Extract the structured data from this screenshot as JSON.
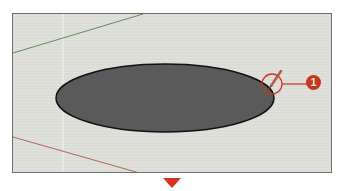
{
  "viewport": {
    "background": "#dcdcd6",
    "green_axis_color": "#5f8a5a",
    "red_axis_color": "#b0645a",
    "blue_axis_color": "#f4f4e8"
  },
  "shape": {
    "type": "ellipse",
    "fill": "#5a5a5a",
    "stroke": "#111111"
  },
  "callout": {
    "number": "1",
    "color": "#c8361f",
    "tool": "pencil-icon"
  },
  "next_step_arrow": {
    "color": "#d9321e"
  }
}
